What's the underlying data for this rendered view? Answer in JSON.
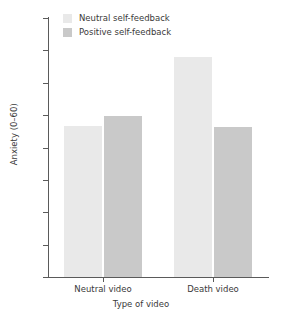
{
  "chart_data": {
    "type": "bar",
    "title": "",
    "subtitle": "",
    "xlabel": "Type of video",
    "ylabel": "Anxiety (0–60)",
    "categories": [
      "Neutral video",
      "Death video"
    ],
    "series": [
      {
        "name": "Neutral self-feedback",
        "values": [
          23.3,
          34.0
        ],
        "color": "#e9e9e9"
      },
      {
        "name": "Positive self-feedback",
        "values": [
          24.8,
          23.2
        ],
        "color": "#c9c9c9"
      }
    ],
    "ylim": [
      0,
      40
    ],
    "yticks": [
      0,
      5,
      10,
      15,
      20,
      25,
      30,
      35,
      40
    ],
    "ytick_labels": [
      "0",
      "5",
      "10",
      "15",
      "20",
      "25",
      "30",
      "35",
      "40"
    ],
    "grid": false,
    "legend_position": "top-left-inside",
    "spines": [
      "left",
      "bottom"
    ],
    "axis_color": "#5a5a5a",
    "text_color": "#3a3a3a",
    "background": "#ffffff"
  },
  "legend": {
    "entries": [
      {
        "label": "Neutral self-feedback",
        "color": "#e9e9e9"
      },
      {
        "label": "Positive self-feedback",
        "color": "#c9c9c9"
      }
    ]
  }
}
